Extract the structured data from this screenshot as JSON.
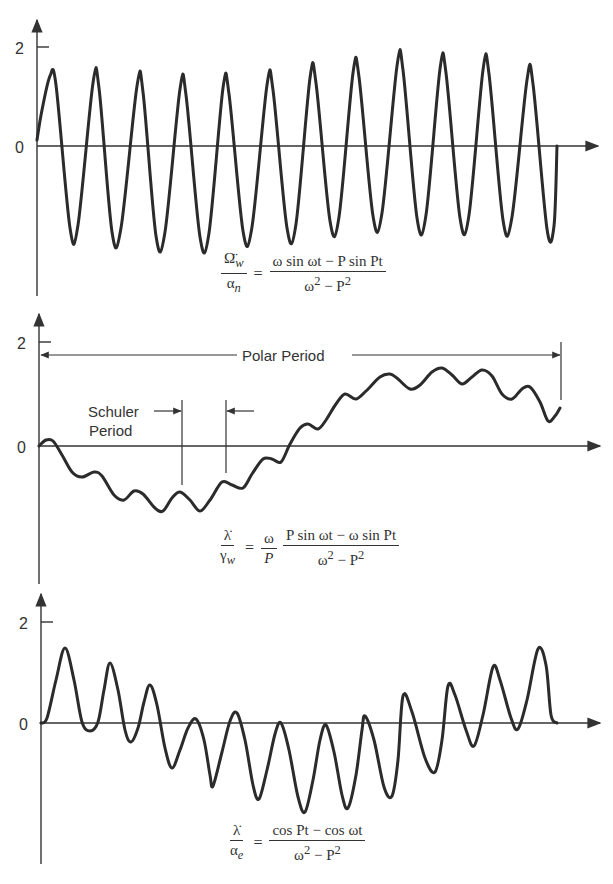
{
  "chart_data": [
    {
      "type": "line",
      "title": "",
      "formula": {
        "lhs_num": "Ω̈_w",
        "lhs_den": "α_n",
        "rhs_num": "ω sin ωt − P sin Pt",
        "rhs_den": "ω² − P²"
      },
      "yticks": [
        {
          "value": 0,
          "label": "0"
        },
        {
          "value": 2,
          "label": "2"
        }
      ],
      "xlabel": "",
      "ylabel": "",
      "description": "Fast oscillation with slowly varying amplitude (~1.4-1.6 peaks, ~-1.6 to -1.8 troughs)",
      "peaks": [
        1.41,
        1.27,
        1.21,
        1.15,
        1.17,
        1.23,
        1.37,
        1.47,
        1.62,
        1.56,
        1.54,
        1.33
      ],
      "troughs": [
        -1.66,
        -1.74,
        -1.82,
        -1.84,
        -1.72,
        -1.66,
        -1.52,
        -1.41,
        -1.45,
        -1.45,
        -1.49,
        -1.68
      ]
    },
    {
      "type": "line",
      "formula": {
        "lhs_num": "λ̇",
        "lhs_den": "γ_w",
        "coef_num": "ω",
        "coef_den": "P",
        "rhs_num": "P sin ωt − ω sin Pt",
        "rhs_den": "ω² − P²"
      },
      "yticks": [
        {
          "value": 0,
          "label": "0"
        },
        {
          "value": 2,
          "label": "2"
        }
      ],
      "annotations": [
        "Polar Period",
        "Schuler Period"
      ],
      "description": "Slow polar-period oscillation with small Schuler-period ripple; min ~ -1.3, max ~ 1.5"
    },
    {
      "type": "line",
      "formula": {
        "lhs_num": "λ̇",
        "lhs_den": "α_e",
        "rhs_num": "cos Pt − cos ωt",
        "rhs_den": "ω² − P²"
      },
      "yticks": [
        {
          "value": 0,
          "label": "0"
        },
        {
          "value": 2,
          "label": "2"
        }
      ],
      "description": "Oscillation whose envelope dips below zero mid-period; peaks 1.66 → 0 → 1.68, troughs ~0 → -1.76 → ~0",
      "peaks": [
        1.66,
        1.37,
        1.05,
        0.54,
        0.16,
        0.0,
        -0.04,
        0.14,
        0.53,
        0.73,
        1.11,
        1.47,
        1.68
      ],
      "troughs": [
        -0.16,
        -0.37,
        -0.89,
        -1.25,
        -1.51,
        -1.76,
        -1.68,
        -1.45,
        -0.97,
        -0.46,
        -0.12
      ]
    }
  ],
  "panel1": {
    "tick2": "2",
    "tick0": "0",
    "lhs_num": "Ω̈",
    "lhs_num_sub": "w",
    "lhs_den": "α",
    "lhs_den_sub": "n",
    "rhs_num": "ω sin ωt − P sin Pt",
    "rhs_den_a": "ω",
    "rhs_den_b": "2",
    "rhs_den_c": " − P",
    "rhs_den_d": "2"
  },
  "panel2": {
    "tick2": "2",
    "tick0": "0",
    "polar_label": "Polar Period",
    "schuler_line1": "Schuler",
    "schuler_line2": "Period",
    "lhs_num": "λ̇",
    "lhs_den": "γ",
    "lhs_den_sub": "w",
    "coef_num": "ω",
    "coef_den": "P",
    "rhs_num": "P sin ωt − ω sin Pt",
    "rhs_den_a": "ω",
    "rhs_den_b": "2",
    "rhs_den_c": " − P",
    "rhs_den_d": "2"
  },
  "panel3": {
    "tick2": "2",
    "tick0": "0",
    "lhs_num": "λ̇",
    "lhs_den": "α",
    "lhs_den_sub": "e",
    "rhs_num": "cos Pt − cos ωt",
    "rhs_den_a": "ω",
    "rhs_den_b": "2",
    "rhs_den_c": " − P",
    "rhs_den_d": "2"
  },
  "curves": {
    "p1": [
      [
        37,
        140
      ],
      [
        42,
        110
      ],
      [
        50,
        76
      ],
      [
        56,
        85
      ],
      [
        70,
        228
      ],
      [
        78,
        225
      ],
      [
        93,
        83
      ],
      [
        99,
        88
      ],
      [
        112,
        232
      ],
      [
        121,
        228
      ],
      [
        137,
        86
      ],
      [
        143,
        92
      ],
      [
        156,
        236
      ],
      [
        165,
        232
      ],
      [
        180,
        89
      ],
      [
        186,
        95
      ],
      [
        200,
        237
      ],
      [
        209,
        233
      ],
      [
        223,
        88
      ],
      [
        229,
        94
      ],
      [
        243,
        231
      ],
      [
        252,
        227
      ],
      [
        267,
        85
      ],
      [
        273,
        90
      ],
      [
        287,
        228
      ],
      [
        296,
        224
      ],
      [
        310,
        78
      ],
      [
        316,
        83
      ],
      [
        330,
        221
      ],
      [
        339,
        217
      ],
      [
        353,
        73
      ],
      [
        359,
        77
      ],
      [
        373,
        216
      ],
      [
        382,
        213
      ],
      [
        397,
        66
      ],
      [
        403,
        70
      ],
      [
        417,
        218
      ],
      [
        426,
        215
      ],
      [
        440,
        69
      ],
      [
        446,
        73
      ],
      [
        460,
        218
      ],
      [
        469,
        215
      ],
      [
        483,
        70
      ],
      [
        489,
        74
      ],
      [
        503,
        220
      ],
      [
        512,
        217
      ],
      [
        527,
        80
      ],
      [
        533,
        84
      ],
      [
        547,
        229
      ],
      [
        554,
        226
      ],
      [
        557,
        146
      ]
    ],
    "p2": [
      [
        39,
        446
      ],
      [
        46,
        440
      ],
      [
        53,
        441
      ],
      [
        62,
        455
      ],
      [
        72,
        472
      ],
      [
        82,
        477
      ],
      [
        94,
        472
      ],
      [
        102,
        476
      ],
      [
        114,
        495
      ],
      [
        124,
        500
      ],
      [
        134,
        491
      ],
      [
        143,
        494
      ],
      [
        155,
        508
      ],
      [
        163,
        511
      ],
      [
        172,
        498
      ],
      [
        180,
        492
      ],
      [
        190,
        500
      ],
      [
        200,
        511
      ],
      [
        210,
        500
      ],
      [
        222,
        482
      ],
      [
        232,
        485
      ],
      [
        243,
        488
      ],
      [
        252,
        474
      ],
      [
        263,
        459
      ],
      [
        272,
        459
      ],
      [
        281,
        462
      ],
      [
        290,
        444
      ],
      [
        300,
        428
      ],
      [
        308,
        424
      ],
      [
        318,
        429
      ],
      [
        326,
        420
      ],
      [
        336,
        404
      ],
      [
        345,
        394
      ],
      [
        356,
        399
      ],
      [
        366,
        391
      ],
      [
        380,
        377
      ],
      [
        390,
        374
      ],
      [
        398,
        379
      ],
      [
        410,
        389
      ],
      [
        420,
        385
      ],
      [
        432,
        372
      ],
      [
        442,
        368
      ],
      [
        452,
        375
      ],
      [
        462,
        384
      ],
      [
        472,
        377
      ],
      [
        482,
        370
      ],
      [
        492,
        376
      ],
      [
        502,
        394
      ],
      [
        512,
        399
      ],
      [
        522,
        389
      ],
      [
        530,
        387
      ],
      [
        540,
        402
      ],
      [
        548,
        421
      ],
      [
        555,
        416
      ],
      [
        560,
        408
      ]
    ],
    "p3": [
      [
        41,
        723
      ],
      [
        47,
        718
      ],
      [
        56,
        680
      ],
      [
        65,
        648
      ],
      [
        74,
        680
      ],
      [
        82,
        722
      ],
      [
        90,
        731
      ],
      [
        98,
        722
      ],
      [
        104,
        690
      ],
      [
        110,
        663
      ],
      [
        118,
        690
      ],
      [
        125,
        730
      ],
      [
        131,
        742
      ],
      [
        138,
        728
      ],
      [
        144,
        702
      ],
      [
        150,
        685
      ],
      [
        157,
        705
      ],
      [
        165,
        748
      ],
      [
        172,
        768
      ],
      [
        180,
        750
      ],
      [
        188,
        728
      ],
      [
        196,
        719
      ],
      [
        204,
        740
      ],
      [
        210,
        775
      ],
      [
        213,
        786
      ],
      [
        222,
        752
      ],
      [
        230,
        721
      ],
      [
        237,
        713
      ],
      [
        245,
        740
      ],
      [
        253,
        785
      ],
      [
        259,
        799
      ],
      [
        267,
        770
      ],
      [
        275,
        734
      ],
      [
        281,
        723
      ],
      [
        289,
        750
      ],
      [
        298,
        797
      ],
      [
        305,
        812
      ],
      [
        313,
        780
      ],
      [
        320,
        740
      ],
      [
        326,
        725
      ],
      [
        334,
        752
      ],
      [
        342,
        795
      ],
      [
        348,
        808
      ],
      [
        356,
        775
      ],
      [
        362,
        730
      ],
      [
        365,
        716
      ],
      [
        374,
        740
      ],
      [
        384,
        787
      ],
      [
        392,
        796
      ],
      [
        398,
        760
      ],
      [
        403,
        696
      ],
      [
        412,
        712
      ],
      [
        425,
        758
      ],
      [
        435,
        772
      ],
      [
        442,
        740
      ],
      [
        448,
        686
      ],
      [
        455,
        695
      ],
      [
        466,
        730
      ],
      [
        474,
        746
      ],
      [
        483,
        715
      ],
      [
        493,
        667
      ],
      [
        500,
        680
      ],
      [
        511,
        718
      ],
      [
        518,
        729
      ],
      [
        527,
        700
      ],
      [
        538,
        649
      ],
      [
        546,
        665
      ],
      [
        551,
        715
      ],
      [
        557,
        723
      ]
    ]
  }
}
